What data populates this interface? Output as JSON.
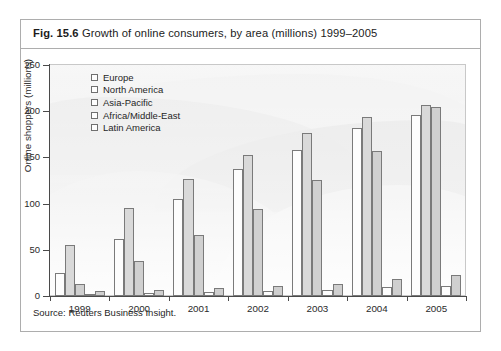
{
  "figure": {
    "number": "Fig. 15.6",
    "title": "Growth of online consumers, by area (millions) 1999–2005",
    "source": "Source: Reuters Business Insight."
  },
  "chart_data": {
    "type": "bar",
    "title": "Growth of online consumers, by area (millions) 1999–2005",
    "xlabel": "",
    "ylabel": "Online shoppers (millions)",
    "ylim": [
      0,
      250
    ],
    "yticks": [
      0,
      50,
      100,
      150,
      200,
      250
    ],
    "grid": false,
    "legend_position": "top-left",
    "categories": [
      "1999",
      "2000",
      "2001",
      "2002",
      "2003",
      "2004",
      "2005"
    ],
    "series": [
      {
        "name": "Europe",
        "values": [
          25,
          62,
          105,
          138,
          158,
          182,
          196
        ]
      },
      {
        "name": "North America",
        "values": [
          55,
          95,
          127,
          153,
          176,
          194,
          207
        ]
      },
      {
        "name": "Asia-Pacific",
        "values": [
          13,
          38,
          66,
          94,
          126,
          157,
          205
        ]
      },
      {
        "name": "Africa/Middle-East",
        "values": [
          2,
          3,
          4,
          5,
          6,
          10,
          11
        ]
      },
      {
        "name": "Latin America",
        "values": [
          5,
          6,
          9,
          11,
          13,
          18,
          23
        ]
      }
    ]
  },
  "colors": {
    "frame_border": "#adadad",
    "axis": "#4a4a4a",
    "bar_outline": "#7a7a7a",
    "plot_background": "#eeeeee"
  }
}
